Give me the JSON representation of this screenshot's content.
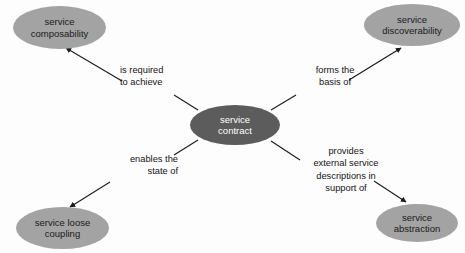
{
  "diagram": {
    "colors": {
      "center_fill": "#5c5c5c",
      "center_text": "#ffffff",
      "outer_fill": "#a3a3a3",
      "outer_text": "#1a1a1a",
      "edge_stroke": "#1a1a1a",
      "background": "#fdfdfd"
    },
    "center_node": {
      "id": "service-contract",
      "label": "service\ncontract"
    },
    "outer_nodes": [
      {
        "id": "service-composability",
        "label": "service\ncomposability"
      },
      {
        "id": "service-discoverability",
        "label": "service\ndiscoverability"
      },
      {
        "id": "service-loose-coupling",
        "label": "service loose\ncoupling"
      },
      {
        "id": "service-abstraction",
        "label": "service\nabstraction"
      }
    ],
    "edges": [
      {
        "id": "edge-composability",
        "from": "service-contract",
        "to": "service-composability",
        "label": "is required\nto achieve"
      },
      {
        "id": "edge-discoverability",
        "from": "service-contract",
        "to": "service-discoverability",
        "label": "forms the\nbasis of"
      },
      {
        "id": "edge-loose-coupling",
        "from": "service-contract",
        "to": "service-loose-coupling",
        "label": "enables the\nstate of"
      },
      {
        "id": "edge-abstraction",
        "from": "service-contract",
        "to": "service-abstraction",
        "label": "provides\nexternal service\ndescriptions in\nsupport of"
      }
    ]
  }
}
